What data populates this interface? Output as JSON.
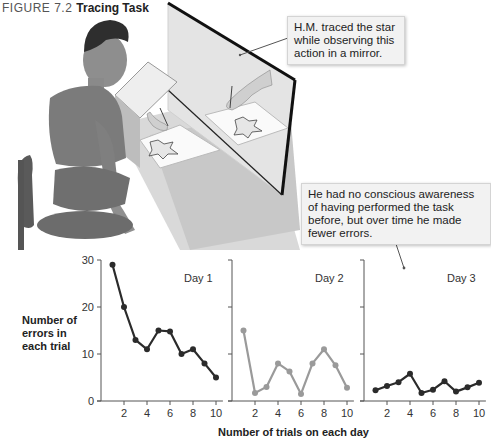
{
  "figure": {
    "number": "FIGURE 7.2",
    "title": "Tracing Task"
  },
  "callouts": {
    "mirror": "H.M. traced the star while observing this action in a mirror.",
    "awareness": "He had no conscious awareness of having performed the task before, but over time he made fewer errors."
  },
  "axes": {
    "ylabel": "Number of errors in each trial",
    "xlabel": "Number of trials on each day"
  },
  "colors": {
    "day1_line": "#2b2b2b",
    "day2_line": "#9a9a9a",
    "day3_line": "#2b2b2b"
  },
  "chart_data": {
    "type": "line",
    "title": "Tracing Task",
    "xlabel": "Number of trials on each day",
    "ylabel": "Number of errors in each trial",
    "x": [
      1,
      2,
      3,
      4,
      5,
      6,
      7,
      8,
      9,
      10
    ],
    "xticks": [
      2,
      4,
      6,
      8,
      10
    ],
    "yticks": [
      0,
      10,
      20,
      30
    ],
    "ylim": [
      0,
      30
    ],
    "grid": false,
    "panels": [
      "Day 1",
      "Day 2",
      "Day 3"
    ],
    "series": [
      {
        "name": "Day 1",
        "values": [
          29,
          20,
          13,
          11,
          15,
          14.8,
          10,
          11,
          8,
          5
        ]
      },
      {
        "name": "Day 2",
        "values": [
          15,
          1.7,
          3,
          8,
          6.3,
          1.5,
          8,
          11,
          7.6,
          2.8
        ]
      },
      {
        "name": "Day 3",
        "values": [
          2.3,
          3.2,
          4,
          5.8,
          1.7,
          2.4,
          4.2,
          2,
          2.9,
          3.9
        ]
      }
    ]
  }
}
